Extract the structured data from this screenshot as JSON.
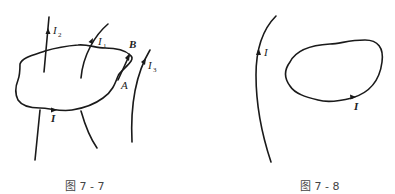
{
  "figures": [
    {
      "id": "fig-7-7",
      "caption": "图 7 - 7",
      "labels": {
        "I2": {
          "main": "I",
          "sub": "2"
        },
        "I1": {
          "main": "I",
          "sub": "1"
        },
        "I3": {
          "main": "I",
          "sub": "3"
        },
        "I": {
          "main": "I"
        },
        "A": "A",
        "B": "B"
      }
    },
    {
      "id": "fig-7-8",
      "caption": "图 7 - 8",
      "labels": {
        "I_wire": "I",
        "I_loop": "I"
      }
    }
  ]
}
